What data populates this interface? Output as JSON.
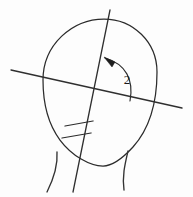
{
  "figure": {
    "background_color": "#fdfdfd",
    "ink_color": "#2b2b2b",
    "labels": {
      "angle_label": "2"
    },
    "annotations": {
      "hatch_count": 2,
      "arrowhead_direction": "up-left"
    },
    "geometry": {
      "canvas": {
        "width": 193,
        "height": 197
      },
      "head_outline": {
        "name": "head-profile",
        "path": "M 104 19 C 133 19 157 42 157 72 C 157 100 150 128 133 147 C 122 159 112 166 103 166 C 90 166 72 156 60 140 C 48 124 43 101 43 80 C 43 45 72 19 104 19 Z"
      },
      "horizontal_reference_line": {
        "name": "frankfort-horizontal-line",
        "x1": 11,
        "y1": 70,
        "x2": 182,
        "y2": 108
      },
      "diagonal_reference_line": {
        "name": "facial-axis-line",
        "x1": 110,
        "y1": 10,
        "x2": 73,
        "y2": 192
      },
      "angle_arc": {
        "name": "angle-arc-2",
        "path": "M 130 101 C 134 80 126 64 105 58",
        "vertex_x": 101,
        "vertex_y": 93
      },
      "arrow_head": {
        "name": "arc-arrowhead",
        "points": "104,57 115,62 112,67"
      },
      "angle_label_position": {
        "x": 127,
        "y": 84
      },
      "hatch_marks": [
        {
          "name": "hatch-mark-upper",
          "x1": 65,
          "y1": 126,
          "x2": 93,
          "y2": 121
        },
        {
          "name": "hatch-mark-lower",
          "x1": 62,
          "y1": 138,
          "x2": 91,
          "y2": 133
        }
      ],
      "neck_curves": [
        {
          "name": "neck-left-curve",
          "path": "M 57 152 C 58 166 54 178 47 192"
        },
        {
          "name": "neck-right-curve",
          "path": "M 128 151 C 125 164 122 176 124 190"
        }
      ]
    }
  }
}
